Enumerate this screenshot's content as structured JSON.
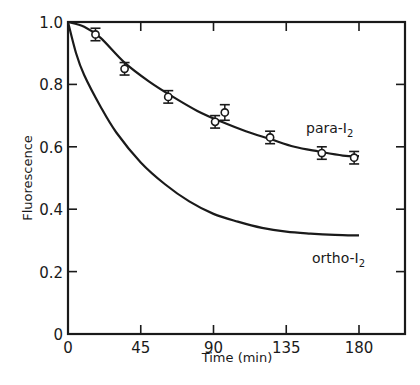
{
  "chart_data": {
    "type": "line",
    "title": "",
    "xlabel": "Time (min)",
    "ylabel": "Fluorescence",
    "xlim": [
      0,
      208
    ],
    "ylim": [
      0,
      1.0
    ],
    "x_ticks": [
      0,
      45,
      90,
      135,
      180
    ],
    "x_tick_labels": [
      "0",
      "45",
      "90",
      "135",
      "180"
    ],
    "y_ticks": [
      0,
      0.2,
      0.4,
      0.6,
      0.8,
      1.0
    ],
    "y_tick_labels": [
      "0",
      "0.2",
      "0.4",
      "0.6",
      "0.8",
      "1.0"
    ],
    "grid": false,
    "legend": "inline labels",
    "series": [
      {
        "name": "para-I2",
        "label_main": "para-I",
        "label_sub": "2",
        "kind": "fit curve with data points (open circles, error bars)",
        "points": [
          {
            "x": 17,
            "y": 0.96,
            "err": 0.02
          },
          {
            "x": 35,
            "y": 0.85,
            "err": 0.02
          },
          {
            "x": 62,
            "y": 0.76,
            "err": 0.02
          },
          {
            "x": 91,
            "y": 0.68,
            "err": 0.02
          },
          {
            "x": 97,
            "y": 0.71,
            "err": 0.025
          },
          {
            "x": 125,
            "y": 0.63,
            "err": 0.02
          },
          {
            "x": 157,
            "y": 0.58,
            "err": 0.02
          },
          {
            "x": 177,
            "y": 0.565,
            "err": 0.02
          }
        ],
        "curve": {
          "x": [
            0,
            10,
            20,
            35,
            50,
            65,
            80,
            95,
            110,
            125,
            140,
            155,
            170,
            180
          ],
          "y": [
            1.0,
            0.985,
            0.95,
            0.87,
            0.81,
            0.76,
            0.715,
            0.68,
            0.65,
            0.625,
            0.6,
            0.585,
            0.572,
            0.57
          ]
        }
      },
      {
        "name": "ortho-I2",
        "label_main": "ortho-I",
        "label_sub": "2",
        "kind": "curve",
        "curve": {
          "x": [
            0,
            5,
            10,
            20,
            30,
            45,
            60,
            75,
            90,
            105,
            120,
            135,
            150,
            165,
            180
          ],
          "y": [
            1.0,
            0.9,
            0.83,
            0.73,
            0.645,
            0.55,
            0.48,
            0.425,
            0.385,
            0.36,
            0.34,
            0.328,
            0.322,
            0.318,
            0.316
          ]
        }
      }
    ]
  }
}
